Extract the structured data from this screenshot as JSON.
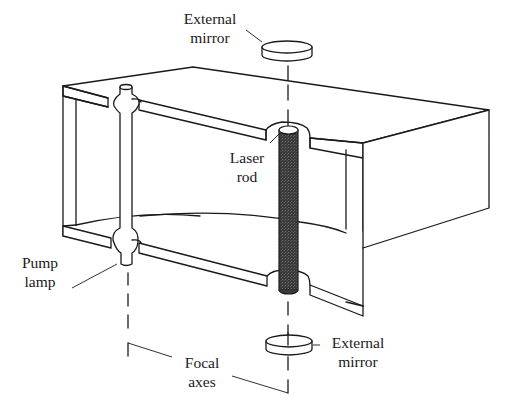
{
  "figure": {
    "colors": {
      "line": "#1a1a1a",
      "background": "#ffffff",
      "laser_rod_fill": "#3a3a3a"
    }
  },
  "labels": {
    "external_mirror_top": {
      "line1": "External",
      "line2": "mirror"
    },
    "laser_rod": {
      "line1": "Laser",
      "line2": "rod"
    },
    "pump_lamp": {
      "line1": "Pump",
      "line2": "lamp"
    },
    "external_mirror_bottom": {
      "line1": "External",
      "line2": "mirror"
    },
    "focal_axes": {
      "line1": "Focal",
      "line2": "axes"
    }
  }
}
